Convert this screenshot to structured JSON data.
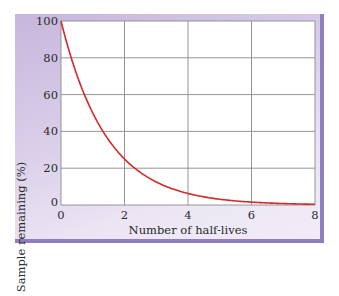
{
  "chart_data": {
    "type": "line",
    "title": "",
    "xlabel": "Number of half-lives",
    "ylabel": "Sample remaining (%)",
    "xlim": [
      0,
      8
    ],
    "ylim": [
      0,
      100
    ],
    "x_ticks": [
      "0",
      "2",
      "4",
      "6",
      "8"
    ],
    "y_ticks": [
      "0",
      "20",
      "40",
      "60",
      "80",
      "100"
    ],
    "grid": true,
    "legend": null,
    "series": [
      {
        "name": "Sample remaining",
        "color": "#d42a2a",
        "x": [
          0,
          0.5,
          1,
          1.5,
          2,
          2.5,
          3,
          3.5,
          4,
          4.5,
          5,
          5.5,
          6,
          6.5,
          7,
          7.5,
          8
        ],
        "values": [
          100,
          70.7,
          50,
          35.4,
          25,
          17.7,
          12.5,
          8.8,
          6.25,
          4.4,
          3.1,
          2.2,
          1.6,
          1.1,
          0.8,
          0.55,
          0.4
        ]
      }
    ]
  },
  "colors": {
    "curve": "#d42a2a",
    "grid": "#8a8a8a",
    "frame_shadow": "#8f7fc2"
  }
}
